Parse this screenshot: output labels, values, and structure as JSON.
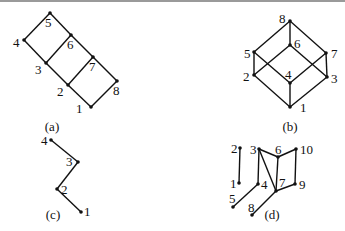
{
  "graphs": [
    {
      "id": "a",
      "caption": "(a)",
      "caption_pos": [
        52,
        131
      ],
      "nodes": [
        {
          "label": "1",
          "x": 91,
          "y": 107,
          "lx": 76,
          "ly": 113
        },
        {
          "label": "2",
          "x": 68,
          "y": 85,
          "lx": 57,
          "ly": 96
        },
        {
          "label": "3",
          "x": 46,
          "y": 63,
          "lx": 35,
          "ly": 74
        },
        {
          "label": "4",
          "x": 24,
          "y": 40,
          "lx": 13,
          "ly": 47
        },
        {
          "label": "5",
          "x": 50,
          "y": 13,
          "lx": 45,
          "ly": 27
        },
        {
          "label": "6",
          "x": 71,
          "y": 35,
          "lx": 67,
          "ly": 49
        },
        {
          "label": "7",
          "x": 93,
          "y": 57,
          "lx": 89,
          "ly": 71
        },
        {
          "label": "8",
          "x": 117,
          "y": 81,
          "lx": 113,
          "ly": 95
        }
      ],
      "edges": [
        [
          "4",
          "5"
        ],
        [
          "5",
          "6"
        ],
        [
          "6",
          "7"
        ],
        [
          "7",
          "8"
        ],
        [
          "4",
          "3"
        ],
        [
          "3",
          "2"
        ],
        [
          "2",
          "1"
        ],
        [
          "1",
          "8"
        ],
        [
          "3",
          "6"
        ],
        [
          "2",
          "7"
        ]
      ]
    },
    {
      "id": "b",
      "caption": "(b)",
      "caption_pos": [
        290,
        131
      ],
      "nodes": [
        {
          "label": "1",
          "x": 290,
          "y": 107,
          "lx": 300,
          "ly": 112
        },
        {
          "label": "2",
          "x": 254,
          "y": 75,
          "lx": 243,
          "ly": 81
        },
        {
          "label": "3",
          "x": 327,
          "y": 77,
          "lx": 331,
          "ly": 83
        },
        {
          "label": "4",
          "x": 290,
          "y": 83,
          "lx": 285,
          "ly": 79
        },
        {
          "label": "5",
          "x": 254,
          "y": 52,
          "lx": 244,
          "ly": 58
        },
        {
          "label": "6",
          "x": 290,
          "y": 45,
          "lx": 294,
          "ly": 48
        },
        {
          "label": "7",
          "x": 326,
          "y": 53,
          "lx": 331,
          "ly": 58
        },
        {
          "label": "8",
          "x": 290,
          "y": 21,
          "lx": 279,
          "ly": 23
        }
      ],
      "edges": [
        [
          "8",
          "5"
        ],
        [
          "8",
          "6"
        ],
        [
          "8",
          "7"
        ],
        [
          "5",
          "2"
        ],
        [
          "5",
          "4"
        ],
        [
          "6",
          "2"
        ],
        [
          "6",
          "3"
        ],
        [
          "7",
          "4"
        ],
        [
          "7",
          "3"
        ],
        [
          "2",
          "1"
        ],
        [
          "4",
          "1"
        ],
        [
          "3",
          "1"
        ]
      ]
    },
    {
      "id": "c",
      "caption": "(c)",
      "caption_pos": [
        53,
        219
      ],
      "nodes": [
        {
          "label": "1",
          "x": 81,
          "y": 212,
          "lx": 84,
          "ly": 216
        },
        {
          "label": "2",
          "x": 57,
          "y": 189,
          "lx": 61,
          "ly": 194
        },
        {
          "label": "3",
          "x": 78,
          "y": 162,
          "lx": 66,
          "ly": 166
        },
        {
          "label": "4",
          "x": 51,
          "y": 140,
          "lx": 41,
          "ly": 145
        }
      ],
      "edges": [
        [
          "4",
          "3"
        ],
        [
          "3",
          "2"
        ],
        [
          "2",
          "1"
        ]
      ]
    },
    {
      "id": "d",
      "caption": "(d)",
      "caption_pos": [
        272,
        219
      ],
      "nodes": [
        {
          "label": "1",
          "x": 239,
          "y": 183,
          "lx": 230,
          "ly": 188
        },
        {
          "label": "2",
          "x": 240,
          "y": 148,
          "lx": 231,
          "ly": 153
        },
        {
          "label": "3",
          "x": 259,
          "y": 149,
          "lx": 250,
          "ly": 154
        },
        {
          "label": "4",
          "x": 258,
          "y": 184,
          "lx": 261,
          "ly": 189
        },
        {
          "label": "5",
          "x": 233,
          "y": 207,
          "lx": 229,
          "ly": 203
        },
        {
          "label": "6",
          "x": 278,
          "y": 157,
          "lx": 275,
          "ly": 154
        },
        {
          "label": "7",
          "x": 276,
          "y": 191,
          "lx": 279,
          "ly": 187
        },
        {
          "label": "8",
          "x": 252,
          "y": 215,
          "lx": 248,
          "ly": 212
        },
        {
          "label": "9",
          "x": 295,
          "y": 184,
          "lx": 299,
          "ly": 189
        },
        {
          "label": "10",
          "x": 296,
          "y": 149,
          "lx": 300,
          "ly": 154
        }
      ],
      "edges": [
        [
          "1",
          "2"
        ],
        [
          "3",
          "4"
        ],
        [
          "3",
          "6"
        ],
        [
          "6",
          "10"
        ],
        [
          "3",
          "7"
        ],
        [
          "6",
          "7"
        ],
        [
          "10",
          "9"
        ],
        [
          "9",
          "7"
        ],
        [
          "4",
          "5"
        ],
        [
          "7",
          "8"
        ]
      ]
    }
  ]
}
